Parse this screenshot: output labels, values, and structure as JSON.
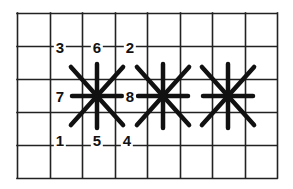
{
  "diagram": {
    "title": "",
    "colors": {
      "grid": "#222222",
      "stitch": "#111111",
      "background": "#ffffff"
    },
    "grid": {
      "left": 17,
      "top": 13,
      "right": 277,
      "bottom": 178,
      "columns": 8,
      "rows": 5
    },
    "labels": [
      {
        "text": "3",
        "x": 60,
        "y": 47
      },
      {
        "text": "6",
        "x": 97,
        "y": 47
      },
      {
        "text": "2",
        "x": 130,
        "y": 47
      },
      {
        "text": "7",
        "x": 60,
        "y": 96
      },
      {
        "text": "8",
        "x": 130,
        "y": 96
      },
      {
        "text": "1",
        "x": 60,
        "y": 140
      },
      {
        "text": "5",
        "x": 97,
        "y": 140
      },
      {
        "text": "4",
        "x": 127,
        "y": 140
      }
    ],
    "stars": [
      {
        "name": "star-stitch-1",
        "cx": 97,
        "cy": 96
      },
      {
        "name": "star-stitch-2",
        "cx": 163,
        "cy": 96
      },
      {
        "name": "star-stitch-3",
        "cx": 228,
        "cy": 96
      }
    ],
    "star_size": {
      "arm_h": 25,
      "arm_v": 32,
      "arm_d": 29
    }
  }
}
